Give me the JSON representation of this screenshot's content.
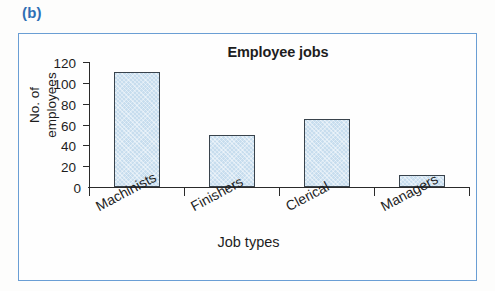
{
  "figure": {
    "label": "(b)",
    "label_color": "#2f6fb5",
    "frame_color": "#6a9ed4"
  },
  "chart_data": {
    "type": "bar",
    "title": "Employee jobs",
    "xlabel": "Job types",
    "ylabel_line1": "No. of",
    "ylabel_line2": "employees",
    "categories": [
      "Machinists",
      "Finishers",
      "Clerical",
      "Managers"
    ],
    "values": [
      110,
      50,
      65,
      12
    ],
    "ylim": [
      0,
      120
    ],
    "yticks": [
      0,
      20,
      40,
      60,
      80,
      100,
      120
    ],
    "ytick_labels": [
      "0",
      "20",
      "40",
      "60",
      "80",
      "100",
      "120"
    ],
    "grid": false,
    "legend": false,
    "bar_fill_color": "#c7ddee",
    "bar_edge_color": "#39434c",
    "axis_color": "#2a2a2a"
  }
}
